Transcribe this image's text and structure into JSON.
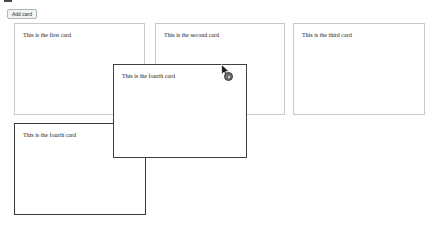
{
  "page": {
    "background_color": "#ffffff",
    "width": 437,
    "height": 232
  },
  "toolbar": {
    "add_card_label": "Add card"
  },
  "colors": {
    "card_border": "#c9c9c9",
    "card_border_active": "#3a3a3a",
    "placeholder_border": "#e2e2e2",
    "button_background": "#f3f3f3",
    "button_border": "#b4b4b4",
    "text": "#1b1b1b",
    "drag_badge": "#6f6f6f"
  },
  "board": {
    "cards": [
      {
        "id": "card-1",
        "text": "This is the first card",
        "x": 14,
        "y": 23,
        "width": 131,
        "height": 92,
        "state": "normal"
      },
      {
        "id": "card-2",
        "text": "This is the second card",
        "x": 155,
        "y": 23,
        "width": 130,
        "height": 92,
        "state": "normal"
      },
      {
        "id": "card-3",
        "text": "This is the third card",
        "x": 293,
        "y": 23,
        "width": 132,
        "height": 92,
        "state": "normal"
      },
      {
        "id": "card-4",
        "text": "This is the fourth card",
        "x": 14,
        "y": 123,
        "width": 132,
        "height": 92,
        "state": "source"
      }
    ],
    "placeholder": {
      "id": "drop-placeholder",
      "x": 116,
      "y": 63,
      "width": 28,
      "height": 92,
      "state": "placeholder"
    },
    "dragging_card": {
      "id": "card-4-ghost",
      "text": "This is the fourth card",
      "x": 113,
      "y": 64,
      "width": 134,
      "height": 94,
      "state": "dragging"
    }
  },
  "pointer": {
    "cursor_icon": "arrow-cursor-icon",
    "badge_icon": "drag-handle-badge-icon",
    "x": 221,
    "y": 64
  }
}
